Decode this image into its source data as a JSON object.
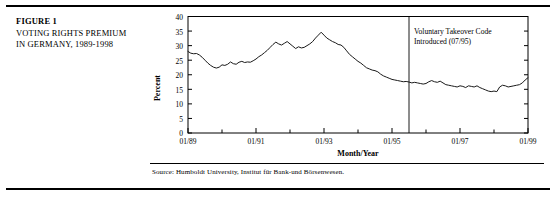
{
  "figure": {
    "label": "FIGURE 1",
    "caption_line_1": "VOTING RIGHTS PREMIUM",
    "caption_line_2": "IN GERMANY, 1989-1998",
    "source": "Source: Humboldt University, Institut für Bank-und Börsenwesen.",
    "line_color": "#1a1a1a",
    "frame_color": "#000000"
  },
  "chart_data": {
    "type": "line",
    "title": "",
    "xlabel": "Month/Year",
    "ylabel": "Percent",
    "ylim": [
      0,
      40
    ],
    "yticks": [
      0,
      5,
      10,
      15,
      20,
      25,
      30,
      35,
      40
    ],
    "xticks": [
      "01/89",
      "01/91",
      "01/93",
      "01/95",
      "01/97",
      "01/99"
    ],
    "xlim": [
      "01/89",
      "01/99"
    ],
    "grid": false,
    "legend": "none",
    "annotations": [
      {
        "name": "voluntary-takeover-code",
        "line_1": "Voluntary Takeover Code",
        "line_2": "Introduced (07/95)",
        "at_x": "07/95",
        "marker": "vertical-line"
      }
    ],
    "series": [
      {
        "name": "Voting rights premium",
        "x": [
          "01/89",
          "02/89",
          "03/89",
          "04/89",
          "05/89",
          "06/89",
          "07/89",
          "08/89",
          "09/89",
          "10/89",
          "11/89",
          "12/89",
          "01/90",
          "02/90",
          "03/90",
          "04/90",
          "05/90",
          "06/90",
          "07/90",
          "08/90",
          "09/90",
          "10/90",
          "11/90",
          "12/90",
          "01/91",
          "02/91",
          "03/91",
          "04/91",
          "05/91",
          "06/91",
          "07/91",
          "08/91",
          "09/91",
          "10/91",
          "11/91",
          "12/91",
          "01/92",
          "02/92",
          "03/92",
          "04/92",
          "05/92",
          "06/92",
          "07/92",
          "08/92",
          "09/92",
          "10/92",
          "11/92",
          "12/92",
          "01/93",
          "02/93",
          "03/93",
          "04/93",
          "05/93",
          "06/93",
          "07/93",
          "08/93",
          "09/93",
          "10/93",
          "11/93",
          "12/93",
          "01/94",
          "02/94",
          "03/94",
          "04/94",
          "05/94",
          "06/94",
          "07/94",
          "08/94",
          "09/94",
          "10/94",
          "11/94",
          "12/94",
          "01/95",
          "02/95",
          "03/95",
          "04/95",
          "05/95",
          "06/95",
          "07/95",
          "08/95",
          "09/95",
          "10/95",
          "11/95",
          "12/95",
          "01/96",
          "02/96",
          "03/96",
          "04/96",
          "05/96",
          "06/96",
          "07/96",
          "08/96",
          "09/96",
          "10/96",
          "11/96",
          "12/96",
          "01/97",
          "02/97",
          "03/97",
          "04/97",
          "05/97",
          "06/97",
          "07/97",
          "08/97",
          "09/97",
          "10/97",
          "11/97",
          "12/97",
          "01/98",
          "02/98",
          "03/98",
          "04/98",
          "05/98",
          "06/98",
          "07/98",
          "08/98",
          "09/98",
          "10/98",
          "11/98",
          "12/98",
          "01/99"
        ],
        "values": [
          28.0,
          27.4,
          27.2,
          27.3,
          26.8,
          26.0,
          25.0,
          24.0,
          23.2,
          22.6,
          22.3,
          22.6,
          23.4,
          23.2,
          23.6,
          24.4,
          23.8,
          23.6,
          24.3,
          24.6,
          24.2,
          24.4,
          24.3,
          24.8,
          25.4,
          26.2,
          26.8,
          27.6,
          28.4,
          29.4,
          30.4,
          31.2,
          30.6,
          30.2,
          30.8,
          31.4,
          30.6,
          29.8,
          29.0,
          29.6,
          29.2,
          29.4,
          30.0,
          30.6,
          31.4,
          32.6,
          33.6,
          34.6,
          33.6,
          32.6,
          32.0,
          31.4,
          31.0,
          30.4,
          30.2,
          29.4,
          28.2,
          27.0,
          26.2,
          25.4,
          24.6,
          24.0,
          23.2,
          22.4,
          22.0,
          21.6,
          21.4,
          21.0,
          20.2,
          19.6,
          19.2,
          18.8,
          18.4,
          18.2,
          18.0,
          17.8,
          17.6,
          17.7,
          17.5,
          17.2,
          17.4,
          17.2,
          17.0,
          16.8,
          17.0,
          17.6,
          18.0,
          17.6,
          17.4,
          17.8,
          17.2,
          16.6,
          16.4,
          16.2,
          16.0,
          15.8,
          16.2,
          16.0,
          15.6,
          16.2,
          16.0,
          15.8,
          16.2,
          15.6,
          15.2,
          14.8,
          14.4,
          14.2,
          14.4,
          14.2,
          15.8,
          16.4,
          16.2,
          15.8,
          16.0,
          16.2,
          16.4,
          16.6,
          17.2,
          18.2,
          19.0
        ]
      }
    ]
  }
}
